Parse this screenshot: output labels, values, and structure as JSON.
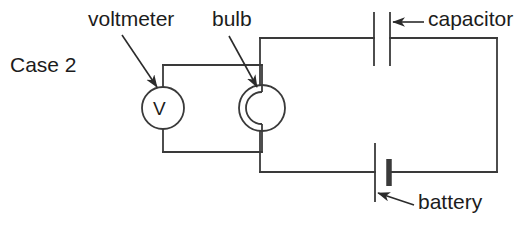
{
  "figure": {
    "case_label": "Case 2",
    "background_color": "#ffffff",
    "line_color": "#3a3a3a",
    "text_color": "#1c1c1c"
  },
  "labels": {
    "voltmeter": "voltmeter",
    "bulb": "bulb",
    "capacitor": "capacitor",
    "battery": "battery"
  },
  "components": {
    "voltmeter": {
      "symbol_letter": "V",
      "shape": "circle-with-letter",
      "center_x": 163,
      "center_y": 108,
      "radius": 21
    },
    "bulb": {
      "symbol_letter": "",
      "shape": "circle-with-arc-filament",
      "center_x": 262,
      "center_y": 108,
      "radius": 23
    },
    "capacitor": {
      "shape": "two-parallel-plates",
      "plate_left_x": 374,
      "plate_right_x": 390,
      "plate_top_y": 12,
      "plate_bottom_y": 66
    },
    "battery": {
      "shape": "long-and-short-plate",
      "long_plate_x": 375,
      "short_plate_x": 389,
      "long_plate_top_y": 143,
      "long_plate_bottom_y": 202,
      "short_plate_top_y": 159,
      "short_plate_bottom_y": 186
    }
  },
  "circuit": {
    "main_loop": {
      "left_x": 260,
      "right_x": 497,
      "top_y": 38,
      "bottom_y": 172
    },
    "voltmeter_loop": {
      "left_x": 163,
      "right_x": 262,
      "top_y": 65,
      "bottom_y": 152
    }
  },
  "annotations": {
    "voltmeter_arrow": {
      "from_x": 122,
      "from_y": 35,
      "to_x": 157,
      "to_y": 87
    },
    "bulb_arrow": {
      "from_x": 229,
      "from_y": 36,
      "to_x": 257,
      "to_y": 87
    },
    "capacitor_arrow": {
      "from_x": 424,
      "from_y": 22,
      "to_x": 393,
      "to_y": 22
    },
    "battery_arrow": {
      "from_x": 414,
      "from_y": 205,
      "to_x": 378,
      "to_y": 193
    }
  }
}
